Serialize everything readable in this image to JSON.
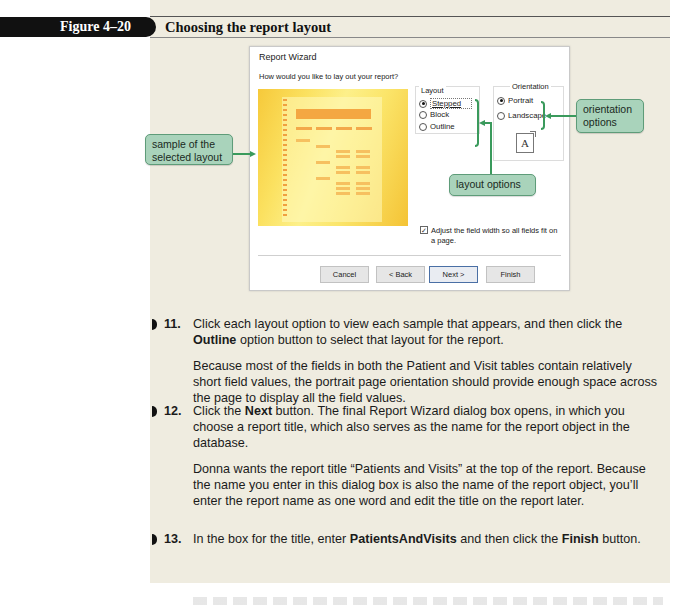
{
  "figure": {
    "label": "Figure 4–20",
    "title": "Choosing the report layout"
  },
  "dialog": {
    "title": "Report Wizard",
    "question": "How would you like to lay out your report?",
    "preview_alt": "sample of the selected layout",
    "layout_group": {
      "legend": "Layout",
      "options": [
        {
          "label": "Stepped",
          "mnemonic_index": 0,
          "selected": true
        },
        {
          "label": "Block",
          "mnemonic_index": 4,
          "selected": false
        },
        {
          "label": "Outline",
          "mnemonic_index": 0,
          "selected": false
        }
      ]
    },
    "orientation_group": {
      "legend": "Orientation",
      "options": [
        {
          "label": "Portrait",
          "selected": true
        },
        {
          "label": "Landscape",
          "selected": false
        }
      ],
      "page_icon_letter": "A"
    },
    "adjust_checkbox": {
      "label": "Adjust the field width so all fields fit on a page.",
      "checked": true,
      "check_glyph": "✓"
    },
    "buttons": {
      "cancel": "Cancel",
      "back": "< Back",
      "next": "Next >",
      "finish": "Finish"
    }
  },
  "callouts": {
    "sample": "sample of the selected layout",
    "orientation": "orientation options",
    "layout": "layout options"
  },
  "steps": [
    {
      "number": "11.",
      "parts": [
        "Click each layout option to view each sample that appears, and then click the ",
        "Outline",
        " option button to select that layout for the report."
      ],
      "note": "Because most of the fields in both the Patient and Visit tables contain relatively short field values, the portrait page orientation should provide enough space across the page to display all the field values."
    },
    {
      "number": "12.",
      "parts": [
        "Click the ",
        "Next",
        " button. The final Report Wizard dialog box opens, in which you choose a report title, which also serves as the name for the report object in the database."
      ],
      "note": "Donna wants the report title “Patients and Visits” at the top of the report. Because the name you enter in this dialog box is also the name of the report object, you’ll enter the report name as one word and edit the title on the report later."
    },
    {
      "number": "13.",
      "parts": [
        "In the box for the title, enter ",
        "PatientsAndVisits",
        " and then click the ",
        "Finish",
        " button."
      ]
    }
  ],
  "colors": {
    "panel_bg": "#efece0",
    "callout_fill": "#a9d3bb",
    "callout_border": "#5e9c79",
    "callout_line": "#3a9a5c",
    "figure_tab": "#111111"
  }
}
